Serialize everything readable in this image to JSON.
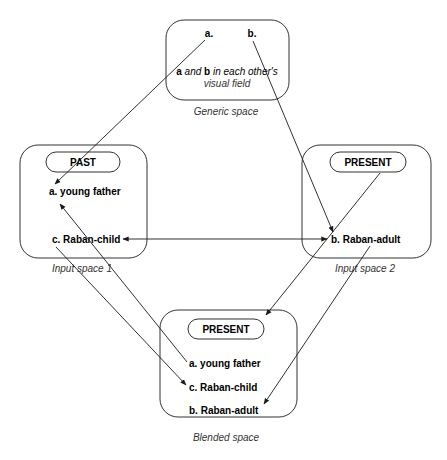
{
  "generic_space": {
    "label": "Generic space",
    "element_a": "a.",
    "element_b": "b.",
    "relation_a": "a",
    "relation_and": " and ",
    "relation_b": "b",
    "relation_rest": " in each other's",
    "relation_line2": "visual field"
  },
  "input_space_1": {
    "label": "Input space 1",
    "frame": "PAST",
    "element_a": "a. young father",
    "element_c": "c. Raban-child"
  },
  "input_space_2": {
    "label": "Input space 2",
    "frame": "PRESENT",
    "element_b": "b. Raban-adult"
  },
  "blended_space": {
    "label": "Blended space",
    "frame": "PRESENT",
    "element_a": "a. young father",
    "element_c": "c. Raban-child",
    "element_b": "b. Raban-adult"
  },
  "caption_partial": ""
}
